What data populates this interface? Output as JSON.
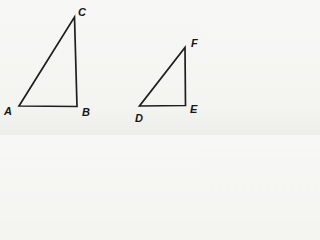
{
  "figure": {
    "background_color": "#f6f6f3",
    "stroke_color": "#1e1e1e",
    "label_color": "#161616",
    "stroke_width": 1.7,
    "triangles": [
      {
        "name": "triangle-abc",
        "points": [
          [
            19,
            106
          ],
          [
            77,
            106.5
          ],
          [
            74.5,
            17
          ]
        ],
        "labels": [
          {
            "name": "label-a",
            "text": "A",
            "x": 4,
            "y": 115,
            "anchor": "start"
          },
          {
            "name": "label-b",
            "text": "B",
            "x": 82,
            "y": 116,
            "anchor": "start"
          },
          {
            "name": "label-c",
            "text": "C",
            "x": 78,
            "y": 16,
            "anchor": "start"
          }
        ]
      },
      {
        "name": "triangle-def",
        "points": [
          [
            139.5,
            106
          ],
          [
            185.5,
            105.5
          ],
          [
            185,
            47.5
          ]
        ],
        "labels": [
          {
            "name": "label-d",
            "text": "D",
            "x": 135,
            "y": 122,
            "anchor": "start"
          },
          {
            "name": "label-e",
            "text": "E",
            "x": 190,
            "y": 113,
            "anchor": "start"
          },
          {
            "name": "label-f",
            "text": "F",
            "x": 191,
            "y": 47,
            "anchor": "start"
          }
        ]
      }
    ]
  }
}
